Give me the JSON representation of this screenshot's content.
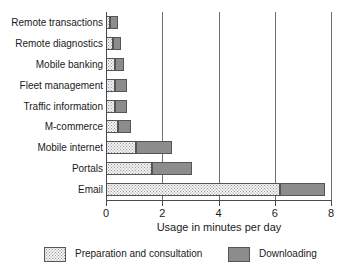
{
  "chart_data": {
    "type": "bar",
    "orientation": "horizontal",
    "stacked": true,
    "title": "",
    "xlabel": "Usage in minutes per day",
    "ylabel": "",
    "xlim": [
      0,
      8
    ],
    "xticks": [
      "0",
      "2",
      "4",
      "6",
      "8"
    ],
    "xtick_values": [
      0,
      2,
      4,
      6,
      8
    ],
    "grid": "vertical",
    "legend_position": "bottom",
    "categories": [
      "Remote transactions",
      "Remote diagnostics",
      "Mobile banking",
      "Fleet management",
      "Traffic information",
      "M-commerce",
      "Mobile internet",
      "Portals",
      "Email"
    ],
    "series": [
      {
        "name": "Preparation and consultation",
        "color": "#f2f2f2",
        "values": [
          0.15,
          0.25,
          0.32,
          0.32,
          0.32,
          0.42,
          1.05,
          1.65,
          6.2
        ]
      },
      {
        "name": "Downloading",
        "color": "#8c8c8c",
        "values": [
          0.28,
          0.28,
          0.33,
          0.43,
          0.43,
          0.46,
          1.3,
          1.4,
          1.6
        ]
      }
    ],
    "totals": [
      0.43,
      0.53,
      0.65,
      0.75,
      0.75,
      0.88,
      2.35,
      3.05,
      7.8
    ]
  },
  "legend": {
    "items": [
      {
        "label": "Preparation and consultation"
      },
      {
        "label": "Downloading"
      }
    ]
  }
}
